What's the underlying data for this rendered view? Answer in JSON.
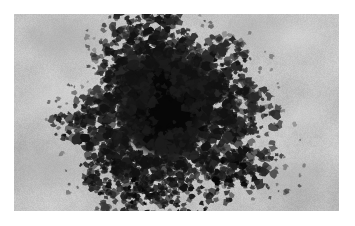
{
  "figure": {
    "kind": "dermoscopy-photograph",
    "modality": "dermoscopy",
    "color_mode": "grayscale",
    "width_px": 355,
    "height_px": 226,
    "border": {
      "color": "#ffffff",
      "left_px": 14,
      "top_px": 14,
      "right_px": 16,
      "bottom_px": 15
    },
    "content_rect": {
      "x": 14,
      "y": 14,
      "width": 325,
      "height": 197
    },
    "visible_text": [],
    "labels": [],
    "scale_bar": null
  },
  "scene": {
    "subject": "pigmented skin lesion",
    "background_skin": {
      "name": "surrounding-skin",
      "base_color": "#c6c6c6",
      "highlight_color": "#e2e2e2",
      "shadow_color": "#a2a2a2",
      "texture": "mottled-granular"
    },
    "lesion": {
      "name": "pigmented-lesion",
      "center": {
        "x": 168,
        "y": 108
      },
      "extent": {
        "x0": 82,
        "y0": 36,
        "x1": 248,
        "y1": 190
      },
      "core_color": "#070707",
      "mid_color": "#1c1c1c",
      "edge_color": "#3a3a3a",
      "border_type": "irregular-globular",
      "symmetry": "asymmetric",
      "core_rect": {
        "x": 128,
        "y": 62,
        "width": 74,
        "height": 86
      }
    },
    "light_blotch": {
      "name": "hypopigmented-blotch",
      "center": {
        "x": 161,
        "y": 146
      },
      "radius": 6,
      "color": "#c0bdb5"
    },
    "hairs": [
      {
        "name": "hair-strand-upper",
        "path": "M 226 70 C 252 48, 284 28, 340 20",
        "width": 1.1,
        "color": "#4a4a4a"
      },
      {
        "name": "hair-strand-upper-branch",
        "path": "M 272 40 C 292 48, 312 62, 330 86",
        "width": 1.0,
        "color": "#555555"
      },
      {
        "name": "hair-strand-right-arc",
        "path": "M 300 14 C 330 36, 344 62, 340 96",
        "width": 1.2,
        "color": "#3f3f3f"
      },
      {
        "name": "hair-strand-lower-arc",
        "path": "M 232 196 C 268 192, 306 166, 330 120",
        "width": 1.1,
        "color": "#4d4d4d"
      },
      {
        "name": "hair-strand-lower-short",
        "path": "M 188 186 C 206 190, 224 194, 238 197",
        "width": 1.0,
        "color": "#5a5a5a"
      },
      {
        "name": "hair-strand-mid-right",
        "path": "M 244 136 C 262 150, 278 166, 288 182",
        "width": 0.9,
        "color": "#606060"
      }
    ],
    "specular_highlights": [
      {
        "name": "highlight-upper-right",
        "x": 296,
        "y": 40,
        "rx": 26,
        "ry": 12,
        "color": "#ececec"
      },
      {
        "name": "highlight-mid-right",
        "x": 300,
        "y": 116,
        "rx": 22,
        "ry": 10,
        "color": "#e6e6e6"
      },
      {
        "name": "highlight-upper-left",
        "x": 58,
        "y": 96,
        "rx": 30,
        "ry": 16,
        "color": "#dedede"
      }
    ],
    "shadow_patches": [
      {
        "name": "shadow-top-left",
        "x": 66,
        "y": 40,
        "rx": 40,
        "ry": 18,
        "color": "#a8a8a8"
      },
      {
        "name": "shadow-bottom-left",
        "x": 48,
        "y": 166,
        "rx": 32,
        "ry": 16,
        "color": "#ababab"
      },
      {
        "name": "shadow-bottom-right",
        "x": 288,
        "y": 176,
        "rx": 36,
        "ry": 14,
        "color": "#b0b0b0"
      },
      {
        "name": "shadow-top-right",
        "x": 250,
        "y": 30,
        "rx": 34,
        "ry": 14,
        "color": "#aeaeae"
      }
    ]
  }
}
